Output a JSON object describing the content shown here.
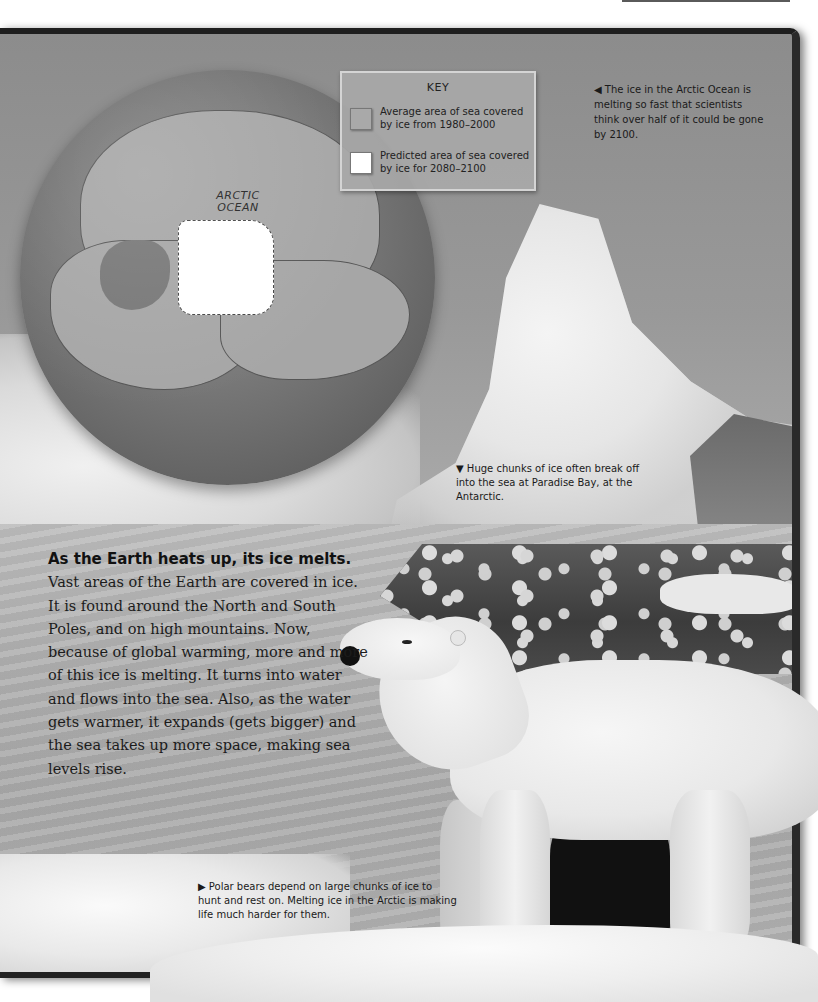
{
  "page": {
    "title_lead": "As the Earth heats up, its ice melts.",
    "body": " Vast areas of the Earth are covered in ice. It is found around the North and South Poles, and on high mountains. Now, because of global warming, more and more of this ice is melting. It turns into water and flows into the sea. Also, as the water gets warmer, it expands (gets bigger) and the sea takes up more space, making sea levels rise."
  },
  "map": {
    "ocean_label_line1": "ARCTIC",
    "ocean_label_line2": "OCEAN",
    "key": {
      "title": "KEY",
      "items": [
        {
          "label": "Average area of sea covered by ice from 1980–2000",
          "swatch_color": "#a9a9a9"
        },
        {
          "label": "Predicted area of sea covered by ice for 2080–2100",
          "swatch_color": "#ffffff"
        }
      ]
    }
  },
  "captions": {
    "arctic": "◀ The ice in the Arctic Ocean is melting so fast that scientists think over half of it could be gone by 2100.",
    "iceberg": "▼ Huge chunks of ice often break off into the sea at Paradise Bay, at the Antarctic.",
    "polar_bear": "▶ Polar bears depend on large chunks of ice to hunt and rest on. Melting ice in the Arctic is making life much harder for them."
  },
  "images": {
    "globe": "globe-arctic-map",
    "iceberg": "iceberg-photo",
    "polar_bear": "polar-bear-photo"
  }
}
